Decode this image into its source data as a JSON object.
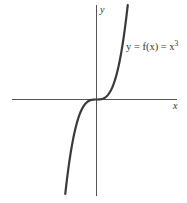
{
  "chart_data": {
    "type": "line",
    "title": "",
    "function": "y = x^3",
    "annotation": "y = f(x) = x³",
    "xlabel": "x",
    "ylabel": "y",
    "grid": false,
    "legend": null,
    "x": [
      -1.4,
      -1.2,
      -1.0,
      -0.8,
      -0.6,
      -0.4,
      -0.2,
      0,
      0.2,
      0.4,
      0.6,
      0.8,
      1.0,
      1.2,
      1.4
    ],
    "values": [
      -2.744,
      -1.728,
      -1.0,
      -0.512,
      -0.216,
      -0.064,
      -0.008,
      0,
      0.008,
      0.064,
      0.216,
      0.512,
      1.0,
      1.728,
      2.744
    ],
    "colors": {
      "curve": "#3a3a3a",
      "axis": "#555555"
    }
  },
  "labels": {
    "x_axis": "x",
    "y_axis": "y",
    "eq_prefix": "y = f(x) = x",
    "eq_exp": "3"
  }
}
